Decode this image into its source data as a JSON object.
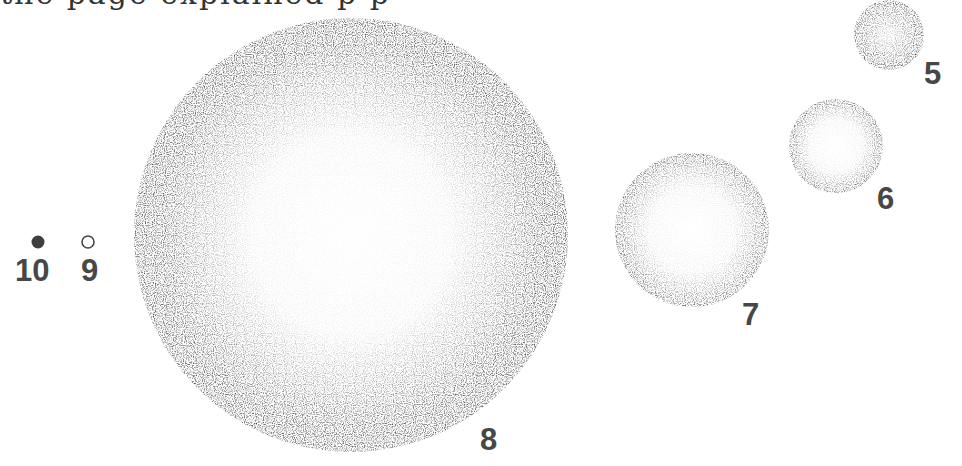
{
  "page": {
    "cut_text_line": "  the page explained      p                                     p"
  },
  "figure": {
    "objects": [
      {
        "id": "5",
        "label": "5",
        "cx": 889,
        "cy": 35,
        "r": 35,
        "style": "stippled-dense"
      },
      {
        "id": "6",
        "label": "6",
        "cx": 836,
        "cy": 146,
        "r": 47,
        "style": "stippled-rim"
      },
      {
        "id": "7",
        "label": "7",
        "cx": 692,
        "cy": 230,
        "r": 77,
        "style": "stippled-rim"
      },
      {
        "id": "8",
        "label": "8",
        "cx": 351,
        "cy": 235,
        "r": 217,
        "style": "stippled-rim-dark"
      },
      {
        "id": "9",
        "label": "9",
        "cx": 88,
        "cy": 242,
        "r": 6,
        "style": "outline"
      },
      {
        "id": "10",
        "label": "10",
        "cx": 38,
        "cy": 242,
        "r": 6,
        "style": "filled"
      }
    ],
    "colors": {
      "ink": "#474747",
      "stipple": "#3a3a3a",
      "background": "#ffffff"
    }
  }
}
